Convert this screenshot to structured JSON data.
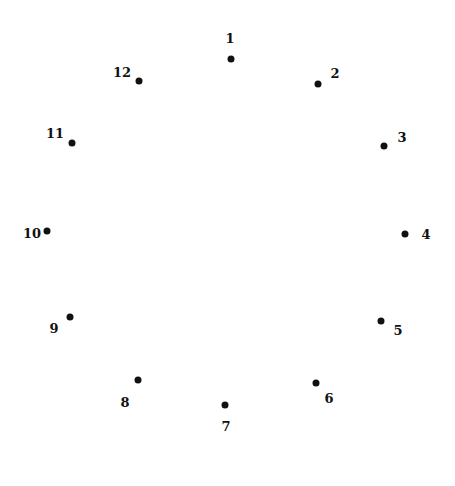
{
  "puzzle": {
    "type": "connect-the-dots",
    "dot_color": "#111111",
    "points": [
      {
        "n": "1",
        "dot": [
          231,
          59
        ],
        "label": [
          230,
          38
        ]
      },
      {
        "n": "2",
        "dot": [
          318,
          84
        ],
        "label": [
          335,
          73
        ]
      },
      {
        "n": "3",
        "dot": [
          384,
          146
        ],
        "label": [
          402,
          137
        ]
      },
      {
        "n": "4",
        "dot": [
          405,
          234
        ],
        "label": [
          426,
          234
        ]
      },
      {
        "n": "5",
        "dot": [
          381,
          321
        ],
        "label": [
          398,
          330
        ]
      },
      {
        "n": "6",
        "dot": [
          316,
          383
        ],
        "label": [
          329,
          398
        ]
      },
      {
        "n": "7",
        "dot": [
          225,
          405
        ],
        "label": [
          226,
          426
        ]
      },
      {
        "n": "8",
        "dot": [
          138,
          380
        ],
        "label": [
          125,
          402
        ]
      },
      {
        "n": "9",
        "dot": [
          70,
          317
        ],
        "label": [
          54,
          328
        ]
      },
      {
        "n": "10",
        "dot": [
          47,
          231
        ],
        "label": [
          32,
          233
        ]
      },
      {
        "n": "11",
        "dot": [
          72,
          143
        ],
        "label": [
          55,
          133
        ]
      },
      {
        "n": "12",
        "dot": [
          139,
          81
        ],
        "label": [
          122,
          72
        ]
      }
    ]
  }
}
